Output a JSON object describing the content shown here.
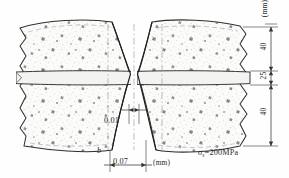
{
  "figure": {
    "type": "engineering-cross-section-diagram",
    "background_color": "#fefefe",
    "ink_color": "#2a2a2a"
  },
  "specimens": {
    "left": {
      "name": "left-specimen-half",
      "fill": "#fbfbfa",
      "speckle": true
    },
    "right": {
      "name": "right-specimen-half",
      "fill": "#fbfbfa",
      "speckle": true
    }
  },
  "plate": {
    "name": "central-plate-layer",
    "fill": "#f2f2f0",
    "thickness_label": "25"
  },
  "vertical_dimensions": {
    "unit_label": "(mm)",
    "entries": [
      {
        "label": "40",
        "segment": "upper-block-height"
      },
      {
        "label": "25",
        "segment": "plate-thickness"
      },
      {
        "label": "40",
        "segment": "lower-block-height"
      }
    ]
  },
  "horizontal_dimensions": {
    "unit_label": "(mm)",
    "entries": [
      {
        "label": "0.01",
        "segment": "neck-gap-width"
      },
      {
        "label": "0.07",
        "segment": "neck-offset-width"
      }
    ]
  },
  "annotations": {
    "width_symbol": "b",
    "stress_symbol": "σ",
    "stress_subscript": "s",
    "stress_equals": "=200MPa",
    "stress_full": "σs=200MPa"
  }
}
